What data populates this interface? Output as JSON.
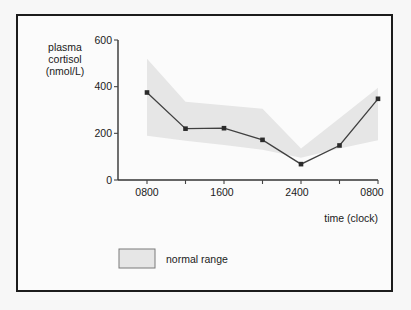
{
  "figure": {
    "background_color": "#f7f7f7",
    "panel_color": "#fbfbfb",
    "border_color": "#1c1c1c"
  },
  "chart_data": {
    "type": "line",
    "title": "",
    "ylabel_lines": [
      "plasma",
      "cortisol",
      "(nmol/L)"
    ],
    "ylabel": "plasma cortisol (nmol/L)",
    "xlabel": "time (clock)",
    "x": [
      800,
      1200,
      1600,
      2000,
      2400,
      400,
      800
    ],
    "x_positions": [
      0,
      1,
      2,
      3,
      4,
      5,
      6
    ],
    "categories": [
      "0800",
      "1200",
      "1600",
      "2000",
      "2400",
      "0400",
      "0800"
    ],
    "xtick_labels": [
      "0800",
      "",
      "1600",
      "",
      "2400",
      "",
      "0800"
    ],
    "xtick_labels_shown": [
      "0800",
      "1600",
      "2400",
      "0800"
    ],
    "ytick_labels": [
      "0",
      "200",
      "400",
      "600"
    ],
    "yticks": [
      0,
      200,
      400,
      600
    ],
    "ylim": [
      0,
      600
    ],
    "xlim": [
      0,
      6
    ],
    "grid": false,
    "legend_position": "below-plot-left",
    "series": [
      {
        "name": "plasma cortisol",
        "type": "line",
        "color": "#404040",
        "marker": "square",
        "values": [
          375,
          220,
          222,
          172,
          68,
          148,
          348
        ]
      }
    ],
    "bands": [
      {
        "name": "normal range",
        "type": "area",
        "color": "#e6e6e6",
        "upper": [
          520,
          335,
          320,
          305,
          135,
          265,
          395
        ],
        "lower": [
          190,
          168,
          150,
          130,
          95,
          135,
          170
        ]
      }
    ],
    "legend": [
      {
        "label": "normal range",
        "swatch_color": "#e6e6e6",
        "swatch_border": "#7a7a7a"
      }
    ]
  }
}
